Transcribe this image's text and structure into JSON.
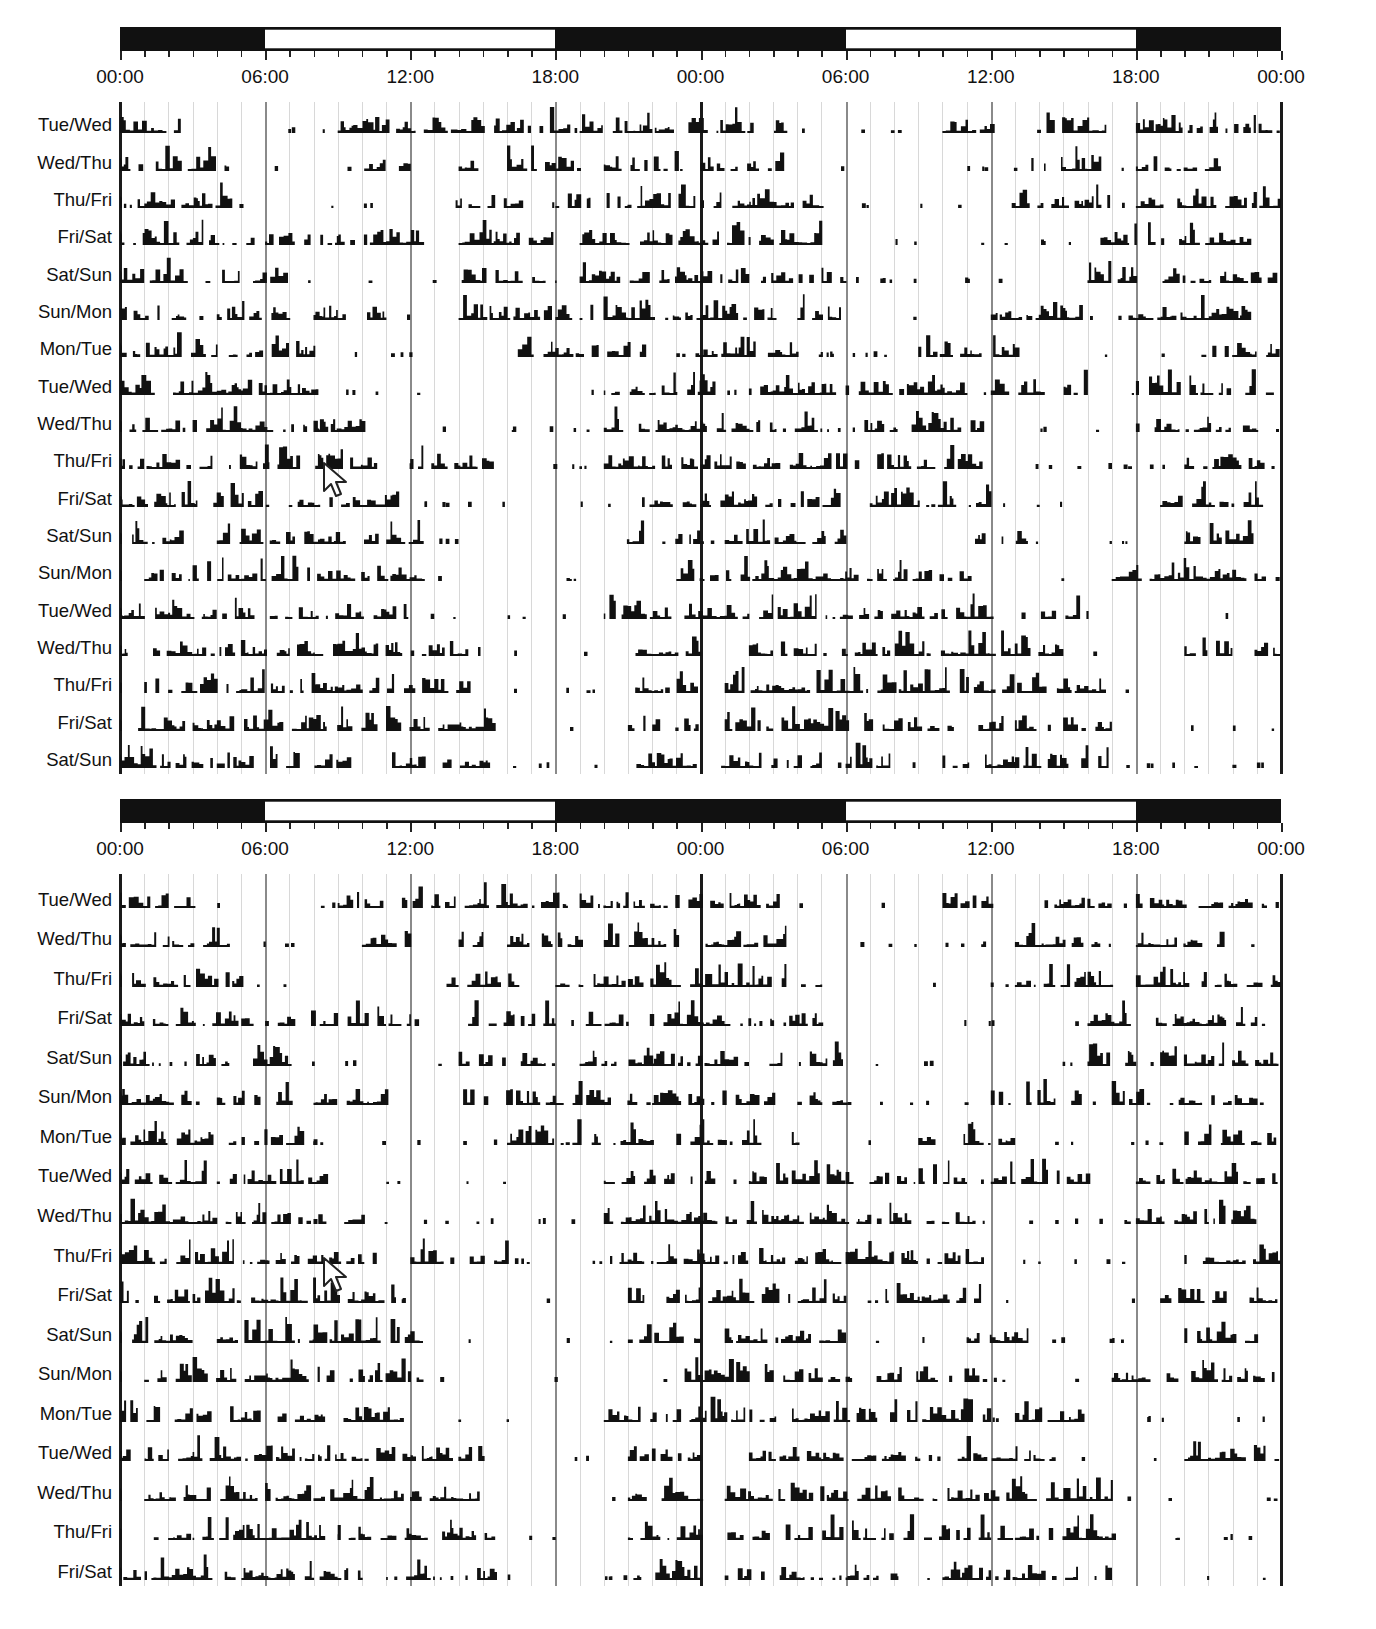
{
  "chart_data": {
    "type": "actogram",
    "title": "",
    "x_axis": {
      "ticks": [
        "00:00",
        "06:00",
        "12:00",
        "18:00",
        "00:00",
        "06:00",
        "12:00",
        "18:00",
        "00:00"
      ],
      "range_hours": [
        0,
        48
      ],
      "minor_tick_every_hours": 1,
      "grid_every_hours": 1,
      "major_grid_every_hours": 6
    },
    "light_dark_schedule": [
      {
        "from": 0,
        "to": 6,
        "state": "dark"
      },
      {
        "from": 6,
        "to": 18,
        "state": "light"
      },
      {
        "from": 18,
        "to": 30,
        "state": "dark"
      },
      {
        "from": 30,
        "to": 42,
        "state": "light"
      },
      {
        "from": 42,
        "to": 48,
        "state": "dark"
      }
    ],
    "panels": [
      {
        "name": "top",
        "rows": [
          "Tue/Wed",
          "Wed/Thu",
          "Thu/Fri",
          "Fri/Sat",
          "Sat/Sun",
          "Sun/Mon",
          "Mon/Tue",
          "Tue/Wed",
          "Wed/Thu",
          "Thu/Fri",
          "Fri/Sat",
          "Sat/Sun",
          "Sun/Mon",
          "Tue/Wed",
          "Wed/Thu",
          "Thu/Fri",
          "Fri/Sat",
          "Sat/Sun"
        ]
      },
      {
        "name": "bottom",
        "rows": [
          "Tue/Wed",
          "Wed/Thu",
          "Thu/Fri",
          "Fri/Sat",
          "Sat/Sun",
          "Sun/Mon",
          "Mon/Tue",
          "Tue/Wed",
          "Wed/Thu",
          "Thu/Fri",
          "Fri/Sat",
          "Sat/Sun",
          "Sun/Mon",
          "Mon/Tue",
          "Tue/Wed",
          "Wed/Thu",
          "Thu/Fri",
          "Fri/Sat"
        ]
      }
    ],
    "activity_profile_note": "Activity bouts per row approximated; main activity bands roughly 11:00-18:00 early rows, drifting to late evening/night in later rows; sparse activity 06:00-12:00 in most rows.",
    "activity_bands": [
      [
        [
          0,
          3
        ],
        [
          9,
          18.5
        ],
        [
          19,
          23
        ],
        [
          23.5,
          27.5
        ],
        [
          34,
          36
        ],
        [
          38,
          41
        ],
        [
          42,
          47.9
        ]
      ],
      [
        [
          0,
          4.5
        ],
        [
          10,
          12
        ],
        [
          14,
          15
        ],
        [
          16,
          19
        ],
        [
          20,
          23
        ],
        [
          24,
          27.5
        ],
        [
          37,
          40.5
        ],
        [
          42,
          45.5
        ]
      ],
      [
        [
          0.5,
          5
        ],
        [
          13.5,
          16.5
        ],
        [
          18,
          21
        ],
        [
          21,
          24
        ],
        [
          24,
          29
        ],
        [
          37,
          41
        ],
        [
          42,
          47.9
        ]
      ],
      [
        [
          0,
          5.5
        ],
        [
          6,
          12.5
        ],
        [
          14,
          18
        ],
        [
          19,
          21
        ],
        [
          21.5,
          26
        ],
        [
          26.5,
          29
        ],
        [
          40,
          42
        ],
        [
          42.5,
          47
        ]
      ],
      [
        [
          0,
          5
        ],
        [
          5.5,
          7
        ],
        [
          14,
          18
        ],
        [
          19,
          22
        ],
        [
          22,
          26
        ],
        [
          26.5,
          30
        ],
        [
          40,
          42
        ],
        [
          43,
          47.9
        ]
      ],
      [
        [
          0,
          3
        ],
        [
          4,
          7
        ],
        [
          8,
          11
        ],
        [
          14,
          18
        ],
        [
          18,
          22
        ],
        [
          22,
          27
        ],
        [
          28,
          30
        ],
        [
          36,
          40
        ],
        [
          41,
          47
        ]
      ],
      [
        [
          0,
          4
        ],
        [
          4.5,
          8
        ],
        [
          16,
          19
        ],
        [
          19.5,
          22
        ],
        [
          23,
          28
        ],
        [
          33,
          37
        ],
        [
          44,
          47.9
        ]
      ],
      [
        [
          0,
          4
        ],
        [
          4,
          8.5
        ],
        [
          20,
          24.5
        ],
        [
          26,
          30
        ],
        [
          30,
          35
        ],
        [
          36,
          40
        ],
        [
          42,
          47.9
        ]
      ],
      [
        [
          0,
          3
        ],
        [
          3,
          8.5
        ],
        [
          8,
          10
        ],
        [
          20,
          24
        ],
        [
          24,
          28
        ],
        [
          28,
          36
        ],
        [
          42,
          47
        ]
      ],
      [
        [
          0,
          6
        ],
        [
          6,
          10.5
        ],
        [
          12,
          16
        ],
        [
          20,
          24
        ],
        [
          24,
          30
        ],
        [
          30,
          36
        ],
        [
          44,
          47.9
        ]
      ],
      [
        [
          0,
          3
        ],
        [
          3,
          8
        ],
        [
          8,
          11.5
        ],
        [
          21,
          24
        ],
        [
          24,
          30
        ],
        [
          31,
          36
        ],
        [
          43,
          47.9
        ]
      ],
      [
        [
          0.5,
          3
        ],
        [
          4,
          8
        ],
        [
          8,
          12.5
        ],
        [
          21,
          24
        ],
        [
          25,
          30
        ],
        [
          35,
          37.5
        ],
        [
          44,
          47
        ]
      ],
      [
        [
          1,
          3
        ],
        [
          3,
          12.5
        ],
        [
          23,
          24
        ],
        [
          24,
          30
        ],
        [
          30,
          36
        ],
        [
          41,
          47.9
        ]
      ],
      [
        [
          0,
          5
        ],
        [
          5,
          12
        ],
        [
          20,
          24
        ],
        [
          24,
          30
        ],
        [
          30,
          36
        ],
        [
          37,
          40
        ]
      ],
      [
        [
          0,
          5
        ],
        [
          5,
          10
        ],
        [
          10,
          15
        ],
        [
          21,
          24
        ],
        [
          26,
          30
        ],
        [
          30,
          35
        ],
        [
          35,
          39
        ],
        [
          44,
          47.9
        ]
      ],
      [
        [
          1,
          3
        ],
        [
          3,
          8
        ],
        [
          8,
          15
        ],
        [
          21,
          24
        ],
        [
          25,
          30
        ],
        [
          30,
          36
        ],
        [
          36,
          41
        ]
      ],
      [
        [
          0.5,
          3
        ],
        [
          3,
          9
        ],
        [
          9,
          15.5
        ],
        [
          21,
          24
        ],
        [
          25,
          32
        ],
        [
          32,
          37
        ],
        [
          37,
          41
        ]
      ],
      [
        [
          0,
          4
        ],
        [
          4,
          10
        ],
        [
          11,
          15.5
        ],
        [
          21,
          24
        ],
        [
          25,
          29
        ],
        [
          30,
          32
        ],
        [
          34,
          37
        ],
        [
          37,
          41
        ]
      ]
    ],
    "annotations": [
      "mouse cursor arrow near 08:30 on Thu/Fri row (both panels)"
    ]
  }
}
